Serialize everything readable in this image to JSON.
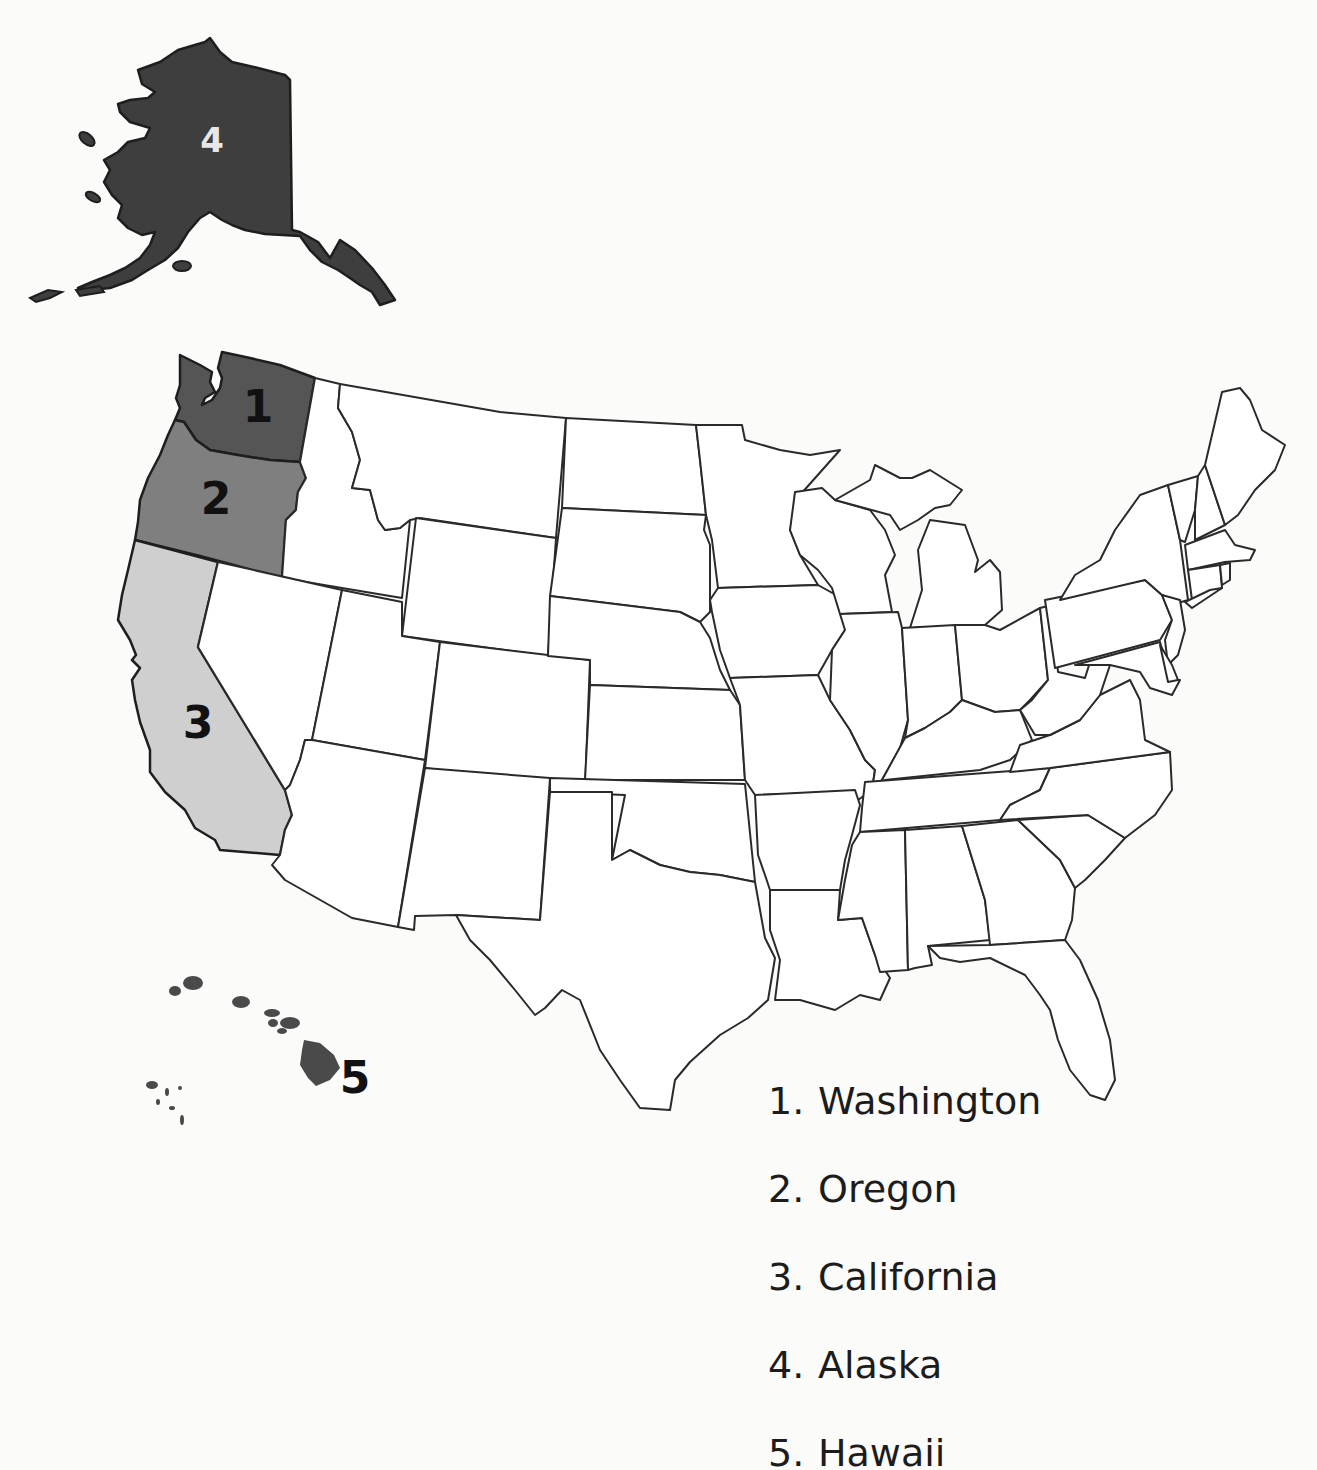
{
  "title_fragment": "",
  "colors": {
    "background": "#fbfbfa",
    "washington": "#555555",
    "oregon": "#7f7f7f",
    "california": "#cfcfcf",
    "alaska": "#3e3e3e",
    "hawaii": "#4a4a4a",
    "other_states": "#ffffff",
    "border": "#2a2a2a"
  },
  "map": {
    "labels": {
      "washington": "1",
      "oregon": "2",
      "california": "3",
      "alaska": "4",
      "hawaii": "5"
    }
  },
  "legend": {
    "items": [
      {
        "number": "1.",
        "name": "Washington"
      },
      {
        "number": "2.",
        "name": "Oregon"
      },
      {
        "number": "3.",
        "name": "California"
      },
      {
        "number": "4.",
        "name": "Alaska"
      },
      {
        "number": "5.",
        "name": "Hawaii"
      }
    ]
  }
}
